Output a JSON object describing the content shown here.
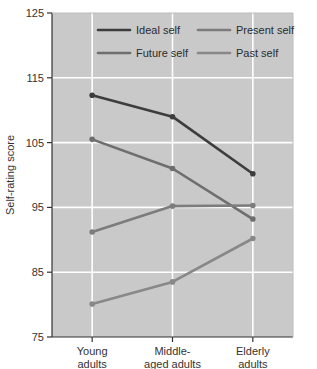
{
  "chart_data": {
    "type": "line",
    "title": "",
    "xlabel": "",
    "ylabel": "Self-rating score",
    "categories": [
      "Young\nadults",
      "Middle-\naged adults",
      "Elderly\nadults"
    ],
    "category_lines": [
      [
        "Young",
        "adults"
      ],
      [
        "Middle-",
        "aged adults"
      ],
      [
        "Elderly",
        "adults"
      ]
    ],
    "ylim": [
      75,
      125
    ],
    "yticks": [
      125,
      115,
      105,
      95,
      85,
      75
    ],
    "ytick_labels": [
      "125",
      "115",
      "105",
      "95",
      "85",
      "75"
    ],
    "grid": true,
    "grid_color": "#ffffff",
    "plot_background": "#c9c9c9",
    "legend_position": "top-inside",
    "series": [
      {
        "name": "Ideal self",
        "color": "#3d3d3d",
        "values": [
          112.3,
          109.0,
          100.2
        ]
      },
      {
        "name": "Future self",
        "color": "#6e6e6e",
        "values": [
          105.5,
          101.0,
          93.2
        ]
      },
      {
        "name": "Present self",
        "color": "#7c7c7c",
        "values": [
          91.2,
          95.2,
          95.3
        ]
      },
      {
        "name": "Past self",
        "color": "#888888",
        "values": [
          80.1,
          83.5,
          90.2
        ]
      }
    ]
  },
  "legend": {
    "entries": [
      {
        "label": "Ideal self"
      },
      {
        "label": "Present self"
      },
      {
        "label": "Future self"
      },
      {
        "label": "Past self"
      }
    ]
  },
  "axes": {
    "y_title": "Self-rating score"
  }
}
